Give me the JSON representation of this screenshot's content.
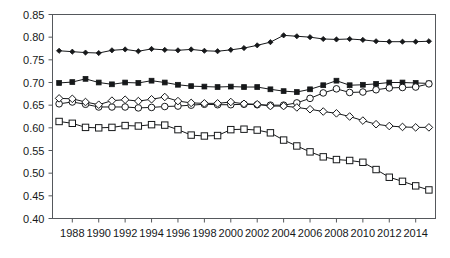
{
  "chart_data": {
    "type": "line",
    "title": "",
    "subtitle": "",
    "xlabel": "",
    "ylabel": "",
    "grid": false,
    "legend": "none",
    "xlim": [
      1986.5,
      2015.5
    ],
    "ylim": [
      0.4,
      0.85
    ],
    "ytick_labels": [
      "0.40",
      "0.45",
      "0.50",
      "0.55",
      "0.60",
      "0.65",
      "0.70",
      "0.75",
      "0.80",
      "0.85"
    ],
    "ytick_values": [
      0.4,
      0.45,
      0.5,
      0.55,
      0.6,
      0.65,
      0.7,
      0.75,
      0.8,
      0.85
    ],
    "xtick_labels": [
      "1988",
      "1990",
      "1992",
      "1994",
      "1996",
      "1998",
      "2000",
      "2002",
      "2004",
      "2006",
      "2008",
      "2010",
      "2012",
      "2014"
    ],
    "xtick_values": [
      1988,
      1990,
      1992,
      1994,
      1996,
      1998,
      2000,
      2002,
      2004,
      2006,
      2008,
      2010,
      2012,
      2014
    ],
    "x": [
      1987,
      1988,
      1989,
      1990,
      1991,
      1992,
      1993,
      1994,
      1995,
      1996,
      1997,
      1998,
      1999,
      2000,
      2001,
      2002,
      2003,
      2004,
      2005,
      2006,
      2007,
      2008,
      2009,
      2010,
      2011,
      2012,
      2013,
      2014,
      2015
    ],
    "series": [
      {
        "name": "series-filled-diamond",
        "marker": "filled-diamond",
        "values": [
          0.77,
          0.768,
          0.766,
          0.765,
          0.771,
          0.773,
          0.769,
          0.774,
          0.772,
          0.771,
          0.773,
          0.77,
          0.769,
          0.772,
          0.776,
          0.782,
          0.789,
          0.804,
          0.802,
          0.8,
          0.796,
          0.795,
          0.796,
          0.794,
          0.791,
          0.79,
          0.79,
          0.79,
          0.791
        ]
      },
      {
        "name": "series-filled-square",
        "marker": "filled-square",
        "values": [
          0.699,
          0.701,
          0.708,
          0.7,
          0.696,
          0.7,
          0.699,
          0.704,
          0.7,
          0.695,
          0.692,
          0.691,
          0.69,
          0.691,
          0.69,
          0.69,
          0.685,
          0.681,
          0.679,
          0.685,
          0.694,
          0.704,
          0.694,
          0.695,
          0.697,
          0.7,
          0.7,
          0.699,
          0.698
        ]
      },
      {
        "name": "series-open-circle",
        "marker": "open-circle",
        "values": [
          0.653,
          0.657,
          0.652,
          0.646,
          0.646,
          0.646,
          0.644,
          0.645,
          0.647,
          0.648,
          0.65,
          0.652,
          0.651,
          0.651,
          0.652,
          0.651,
          0.65,
          0.65,
          0.655,
          0.665,
          0.677,
          0.686,
          0.678,
          0.679,
          0.684,
          0.688,
          0.689,
          0.69,
          0.697
        ]
      },
      {
        "name": "series-open-diamond",
        "marker": "open-diamond",
        "values": [
          0.665,
          0.664,
          0.657,
          0.651,
          0.66,
          0.662,
          0.659,
          0.663,
          0.668,
          0.659,
          0.655,
          0.654,
          0.654,
          0.657,
          0.653,
          0.652,
          0.648,
          0.648,
          0.645,
          0.641,
          0.636,
          0.632,
          0.625,
          0.616,
          0.608,
          0.604,
          0.602,
          0.601,
          0.601
        ]
      },
      {
        "name": "series-open-square",
        "marker": "open-square",
        "values": [
          0.614,
          0.61,
          0.601,
          0.6,
          0.601,
          0.605,
          0.604,
          0.607,
          0.606,
          0.596,
          0.584,
          0.582,
          0.583,
          0.596,
          0.597,
          0.595,
          0.589,
          0.573,
          0.56,
          0.547,
          0.536,
          0.53,
          0.528,
          0.524,
          0.508,
          0.491,
          0.482,
          0.472,
          0.463
        ]
      }
    ]
  }
}
